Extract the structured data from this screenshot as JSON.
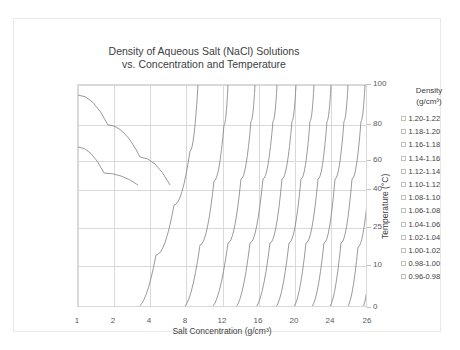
{
  "chart_data": {
    "type": "line",
    "title": "Density of Aqueous Salt (NaCl) Solutions vs. Concentration and Temperature",
    "title_line1": "Density of Aqueous Salt (NaCl) Solutions",
    "title_line2": "vs. Concentration and Temperature",
    "xlabel": "Salt Concentration (g/cm³)",
    "ylabel": "Temperature (°C)",
    "x_categories": [
      "1",
      "2",
      "4",
      "8",
      "12",
      "16",
      "20",
      "24",
      "26"
    ],
    "y_ticks": [
      "100",
      "80",
      "60",
      "40",
      "25",
      "10",
      "0"
    ],
    "ylim": [
      0,
      100
    ],
    "grid": "both",
    "legend_position": "right",
    "legend_title_line1": "Density",
    "legend_title_line2": "(g/cm³)",
    "legend_entries": [
      {
        "label": "1.20-1.22",
        "color": "#ffffff"
      },
      {
        "label": "1.18-1.20",
        "color": "#ffffff"
      },
      {
        "label": "1.16-1.18",
        "color": "#ffffff"
      },
      {
        "label": "1.14-1.16",
        "color": "#ffffff"
      },
      {
        "label": "1.12-1.14",
        "color": "#ffffff"
      },
      {
        "label": "1.10-1.12",
        "color": "#ffffff"
      },
      {
        "label": "1.08-1.10",
        "color": "#ffffff"
      },
      {
        "label": "1.06-1.08",
        "color": "#ffffff"
      },
      {
        "label": "1.04-1.06",
        "color": "#ffffff"
      },
      {
        "label": "1.02-1.04",
        "color": "#ffffff"
      },
      {
        "label": "1.00-1.02",
        "color": "#ffffff"
      },
      {
        "label": "0.98-1.00",
        "color": "#ffffff"
      },
      {
        "label": "0.96-0.98",
        "color": "#ffffff"
      }
    ],
    "contours": [
      {
        "name": "0.96-0.98",
        "points": [
          [
            0,
            62
          ],
          [
            26,
            88
          ],
          [
            60,
            100
          ]
        ]
      },
      {
        "name": "0.98-1.00",
        "points": [
          [
            0,
            10
          ],
          [
            30,
            40
          ],
          [
            62,
            72
          ],
          [
            92,
            100
          ]
        ]
      },
      {
        "name": "1.00-1.02",
        "points": [
          [
            58,
            223
          ],
          [
            78,
            170
          ],
          [
            96,
            120
          ],
          [
            112,
            66
          ],
          [
            120,
            0
          ]
        ]
      },
      {
        "name": "1.02-1.04",
        "points": [
          [
            104,
            223
          ],
          [
            122,
            160
          ],
          [
            136,
            96
          ],
          [
            146,
            40
          ],
          [
            150,
            0
          ]
        ]
      },
      {
        "name": "1.04-1.06",
        "points": [
          [
            132,
            223
          ],
          [
            150,
            158
          ],
          [
            163,
            94
          ],
          [
            173,
            36
          ],
          [
            177,
            0
          ]
        ]
      },
      {
        "name": "1.06-1.08",
        "points": [
          [
            156,
            223
          ],
          [
            172,
            158
          ],
          [
            185,
            94
          ],
          [
            195,
            36
          ],
          [
            199,
            0
          ]
        ]
      },
      {
        "name": "1.08-1.10",
        "points": [
          [
            176,
            223
          ],
          [
            192,
            158
          ],
          [
            204,
            94
          ],
          [
            214,
            36
          ],
          [
            218,
            0
          ]
        ]
      },
      {
        "name": "1.10-1.12",
        "points": [
          [
            196,
            223
          ],
          [
            211,
            158
          ],
          [
            223,
            94
          ],
          [
            232,
            36
          ],
          [
            236,
            0
          ]
        ]
      },
      {
        "name": "1.12-1.14",
        "points": [
          [
            214,
            223
          ],
          [
            228,
            158
          ],
          [
            240,
            94
          ],
          [
            249,
            36
          ],
          [
            253,
            0
          ]
        ]
      },
      {
        "name": "1.14-1.16",
        "points": [
          [
            232,
            223
          ],
          [
            246,
            158
          ],
          [
            257,
            94
          ],
          [
            266,
            36
          ],
          [
            270,
            0
          ]
        ]
      },
      {
        "name": "1.16-1.18",
        "points": [
          [
            250,
            223
          ],
          [
            263,
            158
          ],
          [
            274,
            94
          ],
          [
            283,
            36
          ],
          [
            287,
            0
          ]
        ]
      },
      {
        "name": "1.18-1.20",
        "points": [
          [
            268,
            223
          ],
          [
            280,
            162
          ],
          [
            290,
            108
          ]
        ]
      },
      {
        "name": "1.20-1.22",
        "points": [
          [
            284,
            223
          ],
          [
            290,
            196
          ]
        ]
      }
    ],
    "gridlines_y_px": [
      0,
      40,
      76,
      105,
      143,
      181,
      223
    ],
    "gridlines_x_px": [
      0,
      36,
      72,
      108,
      145,
      181,
      217,
      253,
      290
    ],
    "xlabel_px": [
      0,
      36,
      72,
      108,
      145,
      181,
      217,
      253,
      290
    ],
    "ylabel_px": [
      0,
      40,
      76,
      105,
      143,
      181,
      223
    ],
    "colors": {
      "grid": "#d9d9d9",
      "line": "#808080",
      "text": "#404040"
    }
  }
}
